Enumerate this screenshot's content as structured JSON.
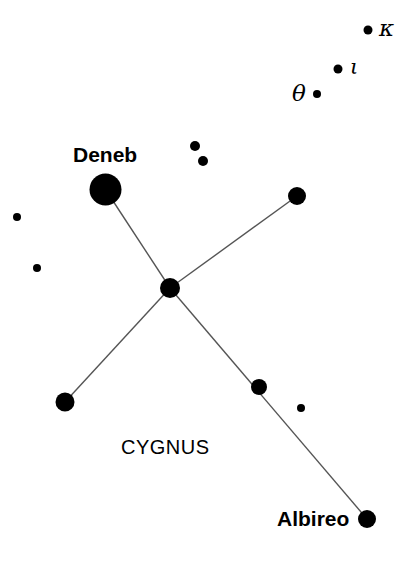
{
  "chart": {
    "width": 408,
    "height": 561,
    "background_color": "#ffffff",
    "ink_color": "#000000",
    "line_color": "#555555"
  },
  "constellation": {
    "name": "CYGNUS",
    "name_x": 121,
    "name_y": 437,
    "name_font_size": 20
  },
  "labels": {
    "deneb": {
      "text": "Deneb",
      "x": 73,
      "y": 144,
      "font_size": 21
    },
    "albireo": {
      "text": "Albireo",
      "x": 277,
      "y": 508,
      "font_size": 21
    },
    "kappa": {
      "text": "κ",
      "x": 379,
      "y": 17,
      "font_size": 23
    },
    "iota": {
      "text": "ι",
      "x": 350,
      "y": 57,
      "font_size": 21
    },
    "theta": {
      "text": "θ",
      "x": 292,
      "y": 82,
      "font_size": 23
    }
  },
  "stars": [
    {
      "name": "deneb",
      "label": "Deneb",
      "x": 105.5,
      "y": 189.5,
      "r": 16.0,
      "magnitude_rank": 1
    },
    {
      "name": "sadr-center",
      "label": "",
      "x": 170.0,
      "y": 288.0,
      "r": 10.0,
      "magnitude_rank": 2
    },
    {
      "name": "gienah-east",
      "label": "",
      "x": 297.0,
      "y": 196.0,
      "r": 9.0,
      "magnitude_rank": 3
    },
    {
      "name": "delta-west",
      "label": "",
      "x": 65.0,
      "y": 402.0,
      "r": 9.5,
      "magnitude_rank": 3
    },
    {
      "name": "eta-neck",
      "label": "",
      "x": 259.0,
      "y": 387.0,
      "r": 8.0,
      "magnitude_rank": 4
    },
    {
      "name": "albireo",
      "label": "Albireo",
      "x": 367.0,
      "y": 519.0,
      "r": 9.0,
      "magnitude_rank": 3
    },
    {
      "name": "kappa-star",
      "label": "κ",
      "x": 368.0,
      "y": 30.0,
      "r": 4.5,
      "magnitude_rank": 6
    },
    {
      "name": "iota-star",
      "label": "ι",
      "x": 338.0,
      "y": 69.0,
      "r": 4.5,
      "magnitude_rank": 6
    },
    {
      "name": "theta-star",
      "label": "θ",
      "x": 317.0,
      "y": 94.0,
      "r": 4.0,
      "magnitude_rank": 6
    },
    {
      "name": "small-upper-a",
      "label": "",
      "x": 195.0,
      "y": 146.0,
      "r": 5.0,
      "magnitude_rank": 5
    },
    {
      "name": "small-upper-b",
      "label": "",
      "x": 203.0,
      "y": 161.0,
      "r": 5.0,
      "magnitude_rank": 5
    },
    {
      "name": "small-left-a",
      "label": "",
      "x": 17.0,
      "y": 217.0,
      "r": 4.0,
      "magnitude_rank": 6
    },
    {
      "name": "small-left-b",
      "label": "",
      "x": 37.0,
      "y": 268.0,
      "r": 4.0,
      "magnitude_rank": 6
    },
    {
      "name": "small-lower-r",
      "label": "",
      "x": 301.0,
      "y": 408.0,
      "r": 4.0,
      "magnitude_rank": 6
    }
  ],
  "lines": [
    {
      "name": "deneb-to-center",
      "x1": 105.5,
      "y1": 189.5,
      "x2": 170.0,
      "y2": 288.0
    },
    {
      "name": "center-to-east",
      "x1": 170.0,
      "y1": 288.0,
      "x2": 297.0,
      "y2": 196.0
    },
    {
      "name": "center-to-west",
      "x1": 170.0,
      "y1": 288.0,
      "x2": 65.0,
      "y2": 402.0
    },
    {
      "name": "center-to-albireo",
      "x1": 170.0,
      "y1": 288.0,
      "x2": 367.0,
      "y2": 519.0
    }
  ],
  "chart_data": {
    "type": "scatter",
    "title": "CYGNUS",
    "xlabel": "",
    "ylabel": "",
    "xlim": [
      0,
      408
    ],
    "ylim": [
      561,
      0
    ],
    "grid": false,
    "legend": "none",
    "note": "Star chart of the constellation Cygnus; dot radius encodes apparent brightness (larger = brighter). Lines are asterism links forming the Northern Cross.",
    "x": [
      105.5,
      170.0,
      297.0,
      65.0,
      259.0,
      367.0,
      368.0,
      338.0,
      317.0,
      195.0,
      203.0,
      17.0,
      37.0,
      301.0
    ],
    "y": [
      189.5,
      288.0,
      196.0,
      402.0,
      387.0,
      519.0,
      30.0,
      69.0,
      94.0,
      146.0,
      161.0,
      217.0,
      268.0,
      408.0
    ],
    "sizes": [
      16.0,
      10.0,
      9.0,
      9.5,
      8.0,
      9.0,
      4.5,
      4.5,
      4.0,
      5.0,
      5.0,
      4.0,
      4.0,
      4.0
    ],
    "point_labels": [
      "Deneb",
      "",
      "",
      "",
      "",
      "Albireo",
      "κ",
      "ι",
      "θ",
      "",
      "",
      "",
      "",
      ""
    ],
    "annotations": [
      "Deneb",
      "Albireo",
      "CYGNUS",
      "κ",
      "ι",
      "θ"
    ]
  }
}
